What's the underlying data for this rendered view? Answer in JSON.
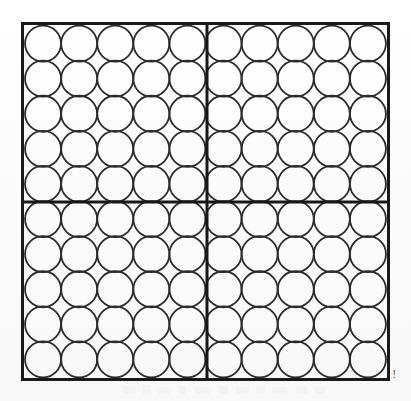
{
  "figure": {
    "kind": "counting-grid",
    "total_circles": 100,
    "grid_columns": 10,
    "grid_rows": 10,
    "quadrant_count": 4,
    "quadrant_columns": 5,
    "quadrant_rows": 5,
    "circle_diameter_px": 36,
    "circle_fill": "none",
    "colors": {
      "background": "#fbfbfb",
      "outline": "#1a1a1a",
      "circle_stroke": "#2b2b2b",
      "divider": "#171717",
      "artifact": "#4a4a4a"
    },
    "box": {
      "x": 21,
      "y": 22,
      "width": 369,
      "height": 359,
      "border_width_px": 3
    },
    "dividers": {
      "vertical_x": 186,
      "horizontal_y": 180,
      "width_px": 3
    },
    "quadrants": [
      {
        "name": "top-left",
        "columns": 5,
        "rows": 5,
        "circles": 25
      },
      {
        "name": "top-right",
        "columns": 5,
        "rows": 5,
        "circles": 25
      },
      {
        "name": "bottom-left",
        "columns": 5,
        "rows": 5,
        "circles": 25
      },
      {
        "name": "bottom-right",
        "columns": 5,
        "rows": 5,
        "circles": 25
      }
    ],
    "artifact_glyph": "!",
    "ghost_marks": [
      {
        "x": 2,
        "y": 1,
        "width": 14,
        "height": 8
      },
      {
        "x": 22,
        "y": 0,
        "width": 9,
        "height": 9
      },
      {
        "x": 38,
        "y": 2,
        "width": 12,
        "height": 7
      },
      {
        "x": 58,
        "y": 1,
        "width": 8,
        "height": 8
      },
      {
        "x": 74,
        "y": 2,
        "width": 16,
        "height": 7
      },
      {
        "x": 98,
        "y": 1,
        "width": 10,
        "height": 8
      },
      {
        "x": 116,
        "y": 2,
        "width": 13,
        "height": 7
      },
      {
        "x": 136,
        "y": 1,
        "width": 9,
        "height": 8
      },
      {
        "x": 152,
        "y": 2,
        "width": 15,
        "height": 7
      },
      {
        "x": 176,
        "y": 1,
        "width": 11,
        "height": 8
      },
      {
        "x": 194,
        "y": 2,
        "width": 12,
        "height": 7
      }
    ]
  }
}
